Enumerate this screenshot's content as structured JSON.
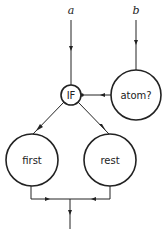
{
  "diagram": {
    "inputs": [
      {
        "id": "a",
        "label": "a"
      },
      {
        "id": "b",
        "label": "b"
      }
    ],
    "nodes": [
      {
        "id": "if",
        "label": "IF"
      },
      {
        "id": "atom",
        "label": "atom?"
      },
      {
        "id": "first",
        "label": "first"
      },
      {
        "id": "rest",
        "label": "rest"
      }
    ],
    "edges": [
      {
        "from": "a",
        "to": "if"
      },
      {
        "from": "b",
        "to": "atom"
      },
      {
        "from": "atom",
        "to": "if"
      },
      {
        "from": "if",
        "to": "first"
      },
      {
        "from": "if",
        "to": "rest"
      },
      {
        "from": "first",
        "to": "output"
      },
      {
        "from": "rest",
        "to": "output"
      }
    ]
  }
}
